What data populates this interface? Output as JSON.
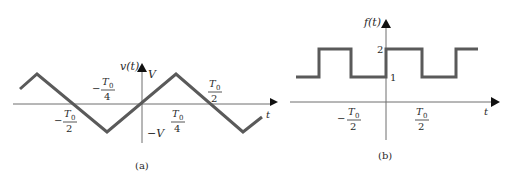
{
  "colors": {
    "axis": "#6e6e6e",
    "waveform": "#5a5a5a",
    "text": "#2a2a2a",
    "background": "#ffffff"
  },
  "panel_a": {
    "caption": "(a)",
    "y_axis_label": "v(t)",
    "x_axis_label": "t",
    "amplitude_pos": "V",
    "amplitude_neg": "−V",
    "tick_neg_T0_over_4": {
      "sign": "−",
      "num": "T",
      "sub": "0",
      "den": "4"
    },
    "tick_T0_over_4": {
      "sign": "",
      "num": "T",
      "sub": "0",
      "den": "4"
    },
    "tick_neg_T0_over_2": {
      "sign": "−",
      "num": "T",
      "sub": "0",
      "den": "2"
    },
    "tick_T0_over_2": {
      "sign": "",
      "num": "T",
      "sub": "0",
      "den": "2"
    },
    "waveform_type": "triangle",
    "points": "20,89 37,74 107,132 176,74 243,132 262,117"
  },
  "panel_b": {
    "caption": "(b)",
    "y_axis_label": "f(t)",
    "x_axis_label": "t",
    "level_high": "2",
    "level_low": "1",
    "tick_neg_T0_over_2": {
      "sign": "−",
      "num": "T",
      "sub": "0",
      "den": "2"
    },
    "tick_T0_over_2": {
      "sign": "",
      "num": "T",
      "sub": "0",
      "den": "2"
    },
    "waveform_type": "square",
    "points": "296,77 319,77 319,49 351,49 351,77 386,77 386,49 422,49 422,77 456,77 456,49 478,49"
  }
}
